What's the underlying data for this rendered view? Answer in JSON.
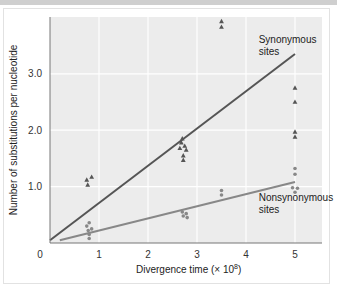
{
  "chart_data": {
    "type": "scatter",
    "title": "",
    "xlabel": "Divergence time (× 10",
    "xlabel_sup": "8",
    "xlabel_close": ")",
    "ylabel": "Number of substitutions per nucleotide",
    "xlim": [
      0,
      5.5
    ],
    "ylim": [
      0,
      4.0
    ],
    "x_ticks": [
      "0",
      "1",
      "2",
      "3",
      "4",
      "5"
    ],
    "y_ticks": [
      "1.0",
      "2.0",
      "3.0"
    ],
    "grid": true,
    "series": [
      {
        "name": "Synonymous sites",
        "marker": "triangle",
        "color": "#555555",
        "points": [
          [
            0.75,
            1.12
          ],
          [
            0.85,
            1.17
          ],
          [
            0.77,
            1.03
          ],
          [
            2.7,
            1.85
          ],
          [
            2.68,
            1.78
          ],
          [
            2.75,
            1.72
          ],
          [
            2.65,
            1.68
          ],
          [
            2.78,
            1.65
          ],
          [
            2.72,
            1.55
          ],
          [
            2.72,
            1.47
          ],
          [
            3.5,
            3.93
          ],
          [
            3.5,
            3.83
          ],
          [
            5.0,
            2.75
          ],
          [
            5.0,
            2.5
          ],
          [
            5.0,
            1.97
          ],
          [
            5.0,
            1.88
          ]
        ],
        "fit_line": [
          [
            0.0,
            0.05
          ],
          [
            5.0,
            3.35
          ]
        ],
        "line_color": "#555555"
      },
      {
        "name": "Nonsynonymous sites",
        "marker": "circle",
        "color": "#888888",
        "points": [
          [
            0.8,
            0.36
          ],
          [
            0.75,
            0.3
          ],
          [
            0.85,
            0.25
          ],
          [
            0.78,
            0.22
          ],
          [
            0.8,
            0.15
          ],
          [
            0.8,
            0.08
          ],
          [
            2.7,
            0.55
          ],
          [
            2.78,
            0.52
          ],
          [
            2.72,
            0.48
          ],
          [
            2.8,
            0.45
          ],
          [
            3.5,
            0.93
          ],
          [
            3.5,
            0.85
          ],
          [
            5.0,
            1.32
          ],
          [
            5.0,
            1.22
          ],
          [
            4.95,
            0.98
          ],
          [
            5.05,
            0.97
          ],
          [
            5.0,
            0.9
          ]
        ],
        "fit_line": [
          [
            0.2,
            0.05
          ],
          [
            5.0,
            1.08
          ]
        ],
        "line_color": "#888888"
      }
    ],
    "annotations": [
      {
        "text": [
          "Synonymous",
          "sites"
        ],
        "x": 4.3,
        "y": 3.55
      },
      {
        "text": [
          "Nonsynonymous",
          "sites"
        ],
        "x": 4.3,
        "y": 0.75
      }
    ],
    "colors": {
      "plot_bg": "#ececec",
      "grid": "#ffffff",
      "axis": "#777777"
    }
  }
}
